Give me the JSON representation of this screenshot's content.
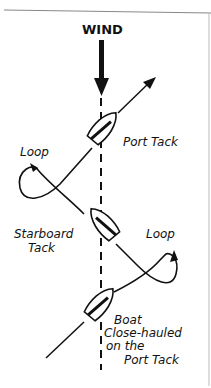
{
  "diagram": {
    "wind_label": "WIND",
    "labels": {
      "port_tack": "Port Tack",
      "loop_left": "Loop",
      "starboard_tack_line1": "Starboard",
      "starboard_tack_line2": "Tack",
      "loop_right": "Loop",
      "boat_line1": "Boat",
      "boat_line2": "Close-hauled",
      "boat_line3": "on the",
      "boat_line4": "Port Tack"
    },
    "colors": {
      "ink": "#111111",
      "background": "#ffffff",
      "frame": "#888888"
    }
  }
}
